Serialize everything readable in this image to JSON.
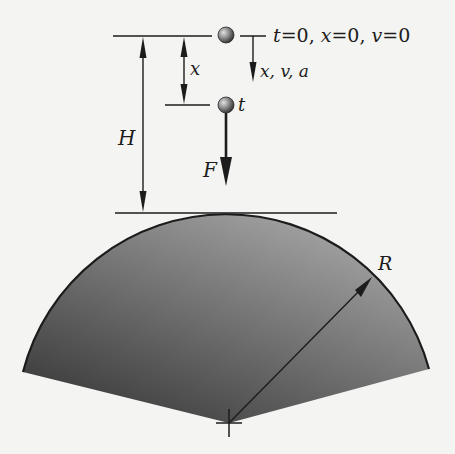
{
  "figure": {
    "type": "physics-diagram",
    "colors": {
      "background": "#f4f4f2",
      "ink": "#1c1c1c",
      "sector_fill_light": "#a8a8a8",
      "sector_fill_dark": "#3c3c3c",
      "ball_light": "#d8d8d8",
      "ball_dark": "#3a3a3a"
    }
  },
  "labels": {
    "initial_conditions": {
      "t": "t",
      "t_val": "=0, ",
      "x": "x",
      "x_val": "=0, ",
      "v": "v",
      "v_val": "=0"
    },
    "displacement": "x",
    "axis_directions": "x, v, a",
    "time_label": "t",
    "height": "H",
    "force": "F",
    "radius": "R"
  },
  "geometry": {
    "top_line": {
      "x1": 113,
      "x2": 212,
      "y": 36
    },
    "ball_initial": {
      "cx": 226,
      "cy": 35,
      "r": 8
    },
    "ball_at_t": {
      "cx": 226,
      "cy": 105,
      "r": 8
    },
    "mid_line": {
      "x1": 165,
      "x2": 210,
      "y": 105
    },
    "tangent_line": {
      "x1": 115,
      "x2": 337,
      "y": 213
    },
    "sector_center": {
      "cx": 229,
      "cy": 423
    },
    "sector_radius": 210,
    "sector_left_corner": {
      "x": 23,
      "y": 372
    },
    "sector_right_corner": {
      "x": 429,
      "y": 369
    }
  }
}
